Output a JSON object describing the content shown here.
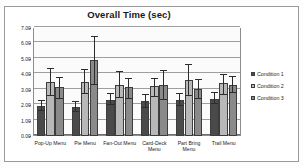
{
  "chart_data": {
    "type": "bar",
    "title": "Overall Time (sec)",
    "xlabel": "",
    "ylabel": "",
    "ylim": [
      0,
      7
    ],
    "ytick_step": 1,
    "ytick_labels": [
      "7.00",
      "6.00",
      "5.00",
      "4.00",
      "3.00",
      "2.00",
      "1.00",
      "0.00"
    ],
    "ytick_values": [
      7,
      6,
      5,
      4,
      3,
      2,
      1,
      0
    ],
    "grid": true,
    "grid_axis": "y",
    "legend_position": "right",
    "categories": [
      "Pop-Up Menu",
      "Pie Menu",
      "Fan-Out Menu",
      "Card-Deck Menu",
      "Part Bring Menu",
      "Trail Menu"
    ],
    "series": [
      {
        "name": "Condition 1",
        "color": "#4a4a4a",
        "values": [
          1.95,
          1.88,
          2.35,
          2.25,
          2.32,
          2.4
        ],
        "error_low": [
          1.62,
          1.55,
          1.98,
          1.82,
          1.95,
          2.05
        ],
        "error_high": [
          2.28,
          2.22,
          2.72,
          2.68,
          2.7,
          2.76
        ]
      },
      {
        "name": "Condition 2",
        "color": "#b8b8b8",
        "values": [
          3.5,
          3.5,
          3.3,
          3.25,
          3.62,
          3.45
        ],
        "error_low": [
          2.62,
          2.7,
          2.45,
          2.55,
          2.62,
          2.65
        ],
        "error_high": [
          4.32,
          4.3,
          4.18,
          3.72,
          4.58,
          3.95
        ]
      },
      {
        "name": "Condition 3",
        "color": "#8a8a8a",
        "values": [
          3.15,
          4.9,
          3.15,
          3.28,
          3.02,
          3.3
        ],
        "error_low": [
          2.4,
          3.28,
          2.38,
          2.34,
          2.42,
          2.8
        ],
        "error_high": [
          3.78,
          6.45,
          3.68,
          4.22,
          3.62,
          3.82
        ]
      }
    ]
  },
  "legend": {
    "items": [
      {
        "label": "Condition 1"
      },
      {
        "label": "Condition 2"
      },
      {
        "label": "Condition 3"
      }
    ]
  }
}
